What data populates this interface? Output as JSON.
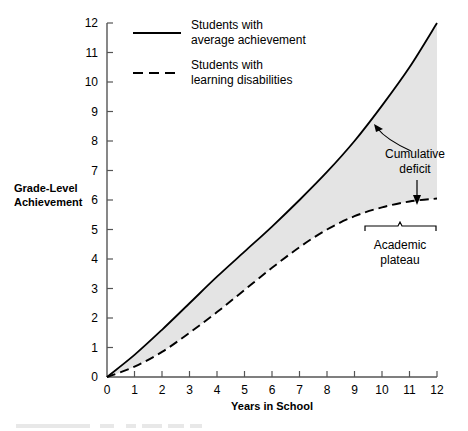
{
  "chart_data": {
    "type": "line",
    "title": "",
    "xlabel": "Years in School",
    "ylabel": "Grade-Level Achievement",
    "xlim": [
      0,
      12
    ],
    "ylim": [
      0,
      12
    ],
    "xticks": [
      "0",
      "1",
      "2",
      "3",
      "4",
      "5",
      "6",
      "7",
      "8",
      "9",
      "10",
      "11",
      "12"
    ],
    "yticks": [
      "0",
      "1",
      "2",
      "3",
      "4",
      "5",
      "6",
      "7",
      "8",
      "9",
      "10",
      "11",
      "12"
    ],
    "grid": false,
    "legend_position": "top-left-inside",
    "fill_between": true,
    "fill_color": "#e4e4e4",
    "line_color": "#000000",
    "x": [
      0,
      1,
      2,
      3,
      4,
      5,
      6,
      7,
      8,
      9,
      10,
      11,
      12
    ],
    "series": [
      {
        "name": "Students with average achievement",
        "style": "solid",
        "values": [
          0,
          0.75,
          1.6,
          2.5,
          3.4,
          4.25,
          5.1,
          6.0,
          6.95,
          8.0,
          9.2,
          10.5,
          12.0
        ]
      },
      {
        "name": "Students with learning disabilities",
        "style": "dashed",
        "values": [
          0,
          0.35,
          0.85,
          1.5,
          2.2,
          2.95,
          3.7,
          4.4,
          5.0,
          5.45,
          5.75,
          5.95,
          6.05
        ]
      }
    ],
    "annotations": [
      {
        "id": "cumulative-deficit",
        "text_line1": "Cumulative",
        "text_line2": "deficit",
        "arrows": [
          "curved-up-left-to-solid-curve",
          "straight-down-to-dashed-curve"
        ]
      },
      {
        "id": "academic-plateau",
        "text_line1": "Academic",
        "text_line2": "plateau",
        "marker": "brace",
        "span_years": [
          9.4,
          12
        ]
      }
    ]
  },
  "legend": {
    "entries": [
      {
        "line1": "Students with",
        "line2": "average achievement",
        "style": "solid"
      },
      {
        "line1": "Students with",
        "line2": "learning disabilities",
        "style": "dashed"
      }
    ]
  },
  "axes": {
    "y_title_line1": "Grade-Level",
    "y_title_line2": "Achievement",
    "x_title": "Years in School"
  }
}
